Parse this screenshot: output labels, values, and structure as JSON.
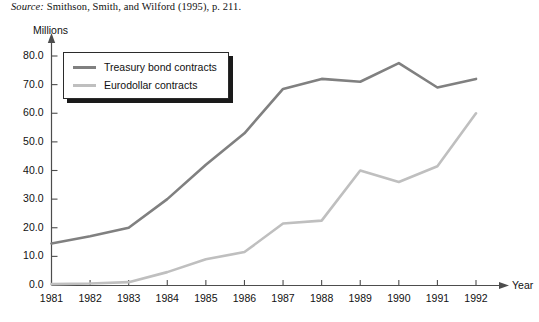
{
  "source_note": {
    "label": "Source:",
    "text": " Smithson, Smith, and Wilford (1995), p. 211."
  },
  "colors": {
    "series_treasury": "#808080",
    "series_eurodollar": "#bfbfbf",
    "axis": "#4d4d4d",
    "text": "#111111",
    "legend_border": "#2b2b2b",
    "legend_shadow": "#1a1a1a",
    "background": "#ffffff"
  },
  "chart_data": {
    "type": "line",
    "title": "",
    "subtitle": "",
    "xlabel": "Year",
    "ylabel": "Millions",
    "categories": [
      "1981",
      "1982",
      "1983",
      "1984",
      "1985",
      "1986",
      "1987",
      "1988",
      "1989",
      "1990",
      "1991",
      "1992"
    ],
    "x": [
      1981,
      1982,
      1983,
      1984,
      1985,
      1986,
      1987,
      1988,
      1989,
      1990,
      1991,
      1992
    ],
    "xlim": [
      1981,
      1992
    ],
    "ylim": [
      0.0,
      80.0
    ],
    "ytick_labels": [
      "80.0",
      "70.0",
      "60.0",
      "50.0",
      "40.0",
      "30.0",
      "20.0",
      "10.0",
      "0.0"
    ],
    "ytick_values": [
      80.0,
      70.0,
      60.0,
      50.0,
      40.0,
      30.0,
      20.0,
      10.0,
      0.0
    ],
    "grid": false,
    "legend_position": "upper-left-inside",
    "series": [
      {
        "name": "Treasury bond contracts",
        "color": "#808080",
        "values": [
          14.5,
          17.0,
          20.0,
          30.0,
          42.0,
          53.0,
          68.5,
          72.0,
          71.0,
          77.5,
          69.0,
          72.0
        ]
      },
      {
        "name": "Eurodollar contracts",
        "color": "#bfbfbf",
        "values": [
          0.3,
          0.5,
          1.0,
          4.5,
          9.0,
          11.5,
          21.5,
          22.5,
          40.0,
          36.0,
          41.5,
          60.0
        ]
      }
    ]
  },
  "legend": {
    "entries": [
      {
        "label": "Treasury bond contracts",
        "swatch": "line-swatch-dark"
      },
      {
        "label": "Eurodollar contracts",
        "swatch": "line-swatch-light"
      }
    ]
  }
}
